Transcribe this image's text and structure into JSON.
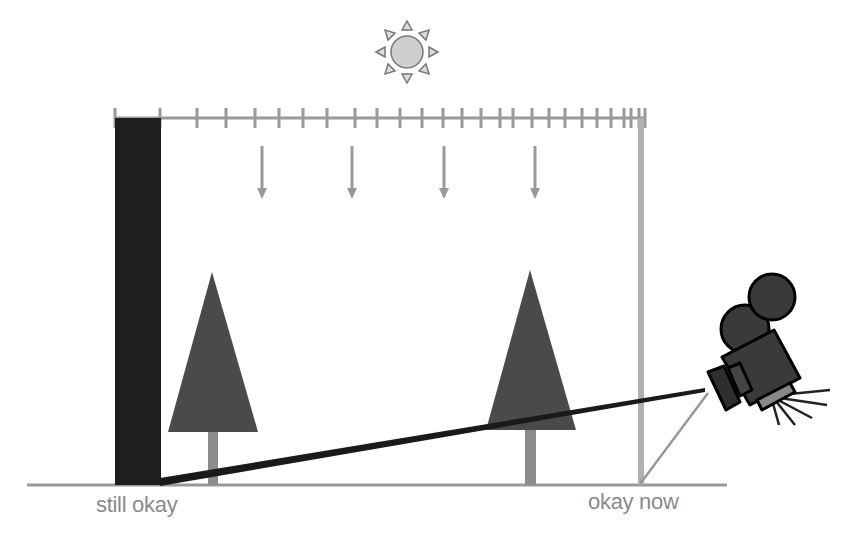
{
  "labels": {
    "left": "still okay",
    "right": "okay now"
  },
  "colors": {
    "background": "#ffffff",
    "gray_line": "#999999",
    "light_gray": "#b3b3b3",
    "dark_fill": "#1e1e1e",
    "tree_fill": "#4a4a4a",
    "trunk": "#8c8c8c",
    "sun_fill": "#cccccc",
    "sun_stroke": "#777777",
    "label_text": "#8a8a8a"
  },
  "ruler": {
    "y": 118,
    "x_start": 115,
    "x_end": 645,
    "tick_positions": [
      115,
      160,
      197,
      226,
      255,
      279,
      303,
      327,
      355,
      377,
      400,
      422,
      443,
      462,
      481,
      500,
      513,
      532,
      549,
      565,
      582,
      597,
      611,
      624,
      631,
      639,
      645
    ]
  },
  "arrows": [
    262,
    352,
    444,
    535
  ],
  "icons": [
    "sun-icon",
    "movie-camera-icon",
    "tree-icon",
    "down-arrow-icon"
  ]
}
